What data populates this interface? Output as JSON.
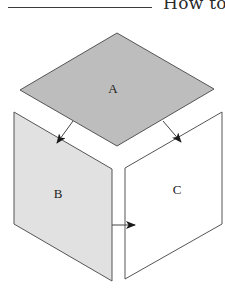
{
  "header": {
    "title": "How to"
  },
  "diagram": {
    "faces": [
      {
        "id": "A",
        "label": "A",
        "fill": "#bdbdbd",
        "stroke": "#555555"
      },
      {
        "id": "B",
        "label": "B",
        "fill": "#e1e1e1",
        "stroke": "#555555"
      },
      {
        "id": "C",
        "label": "C",
        "fill": "#ffffff",
        "stroke": "#555555"
      }
    ],
    "arrows": [
      {
        "from": "A",
        "to": "B"
      },
      {
        "from": "A",
        "to": "C"
      },
      {
        "from": "B",
        "to": "C"
      }
    ]
  }
}
